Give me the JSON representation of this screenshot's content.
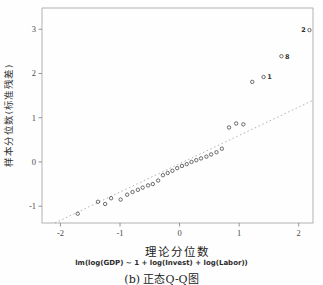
{
  "figure": {
    "caption": "(b) 正态Q-Q图",
    "formula": "lm(log(GDP) ~ 1 + log(Invest) + log(Labor))"
  },
  "chart_data": {
    "type": "scatter",
    "title": "",
    "xlabel": "理论分位数",
    "ylabel": "样本分位数(标准残差)",
    "xlim": [
      -2.31,
      2.24
    ],
    "ylim": [
      -1.38,
      3.48
    ],
    "x_ticks": [
      -2,
      -1,
      0,
      1,
      2
    ],
    "y_ticks": [
      -1,
      0,
      1,
      2,
      3
    ],
    "grid": false,
    "legend": null,
    "reference_line": {
      "style": "dotted",
      "slope": 0.64,
      "intercept": -0.04
    },
    "points": [
      {
        "x": -1.71,
        "y": -1.17
      },
      {
        "x": -1.37,
        "y": -0.9
      },
      {
        "x": -1.25,
        "y": -0.95
      },
      {
        "x": -1.15,
        "y": -0.82
      },
      {
        "x": -0.99,
        "y": -0.85
      },
      {
        "x": -0.88,
        "y": -0.74
      },
      {
        "x": -0.79,
        "y": -0.68
      },
      {
        "x": -0.7,
        "y": -0.63
      },
      {
        "x": -0.62,
        "y": -0.58
      },
      {
        "x": -0.53,
        "y": -0.53
      },
      {
        "x": -0.45,
        "y": -0.5
      },
      {
        "x": -0.36,
        "y": -0.42
      },
      {
        "x": -0.28,
        "y": -0.3
      },
      {
        "x": -0.2,
        "y": -0.25
      },
      {
        "x": -0.12,
        "y": -0.2
      },
      {
        "x": -0.04,
        "y": -0.14
      },
      {
        "x": 0.04,
        "y": -0.09
      },
      {
        "x": 0.12,
        "y": -0.05
      },
      {
        "x": 0.2,
        "y": 0.0
      },
      {
        "x": 0.28,
        "y": 0.04
      },
      {
        "x": 0.36,
        "y": 0.08
      },
      {
        "x": 0.45,
        "y": 0.12
      },
      {
        "x": 0.53,
        "y": 0.17
      },
      {
        "x": 0.62,
        "y": 0.22
      },
      {
        "x": 0.71,
        "y": 0.3
      },
      {
        "x": 0.83,
        "y": 0.78
      },
      {
        "x": 0.95,
        "y": 0.87
      },
      {
        "x": 1.07,
        "y": 0.85
      },
      {
        "x": 1.22,
        "y": 1.81
      },
      {
        "x": 1.41,
        "y": 1.92,
        "label": "1",
        "label_side": "right"
      },
      {
        "x": 1.71,
        "y": 2.39,
        "label": "8",
        "label_side": "right"
      },
      {
        "x": 2.18,
        "y": 2.98,
        "label": "2",
        "label_side": "left"
      }
    ],
    "colors": {
      "point": "#5a5a5a",
      "line": "#8f8f8f",
      "box": "#a0a0a0",
      "tick": "#7a7a7a",
      "text": "#4a4a4a"
    }
  }
}
